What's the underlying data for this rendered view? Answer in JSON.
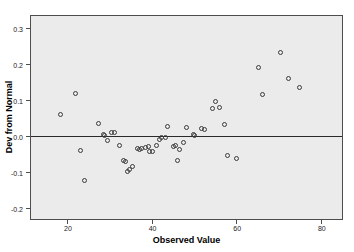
{
  "chart_data": {
    "type": "scatter",
    "title": "",
    "xlabel": "Observed Value",
    "ylabel": "Dev from Normal",
    "xlim": [
      11.5,
      85.0
    ],
    "ylim": [
      -0.232,
      0.333
    ],
    "xticks": [
      20,
      40,
      60,
      80
    ],
    "xtick_labels": [
      "20",
      "40",
      "60",
      "80"
    ],
    "yticks": [
      0.3,
      0.2,
      0.1,
      0.0,
      -0.1,
      -0.2
    ],
    "ytick_labels": [
      "0.3",
      "0.2",
      "0.1",
      "0.0",
      "-0.1",
      "-0.2"
    ],
    "grid": false,
    "legend": null,
    "reference_lines": [
      {
        "axis": "y",
        "value": 0.0
      }
    ],
    "marker": "open-circle",
    "marker_color": "#3a3a3a",
    "plot_background": "#ebebeb",
    "page_background": "#ffffff",
    "points": [
      {
        "x": 18.5,
        "y": 0.058
      },
      {
        "x": 22.0,
        "y": 0.116
      },
      {
        "x": 23.3,
        "y": -0.041
      },
      {
        "x": 24.2,
        "y": -0.125
      },
      {
        "x": 27.5,
        "y": 0.033
      },
      {
        "x": 28.7,
        "y": 0.002
      },
      {
        "x": 28.9,
        "y": 0.0
      },
      {
        "x": 29.5,
        "y": -0.014
      },
      {
        "x": 30.6,
        "y": 0.008
      },
      {
        "x": 31.2,
        "y": 0.01
      },
      {
        "x": 32.5,
        "y": -0.027
      },
      {
        "x": 33.4,
        "y": -0.068
      },
      {
        "x": 33.9,
        "y": -0.071
      },
      {
        "x": 34.3,
        "y": -0.1
      },
      {
        "x": 34.7,
        "y": -0.094
      },
      {
        "x": 35.4,
        "y": -0.085
      },
      {
        "x": 36.6,
        "y": -0.035
      },
      {
        "x": 37.1,
        "y": -0.038
      },
      {
        "x": 37.6,
        "y": -0.037
      },
      {
        "x": 38.6,
        "y": -0.033
      },
      {
        "x": 39.2,
        "y": -0.029
      },
      {
        "x": 39.6,
        "y": -0.045
      },
      {
        "x": 40.2,
        "y": -0.044
      },
      {
        "x": 41.2,
        "y": -0.028
      },
      {
        "x": 41.8,
        "y": -0.012
      },
      {
        "x": 42.4,
        "y": -0.006
      },
      {
        "x": 43.2,
        "y": -0.004
      },
      {
        "x": 43.8,
        "y": 0.026
      },
      {
        "x": 45.1,
        "y": -0.031
      },
      {
        "x": 45.6,
        "y": -0.028
      },
      {
        "x": 46.2,
        "y": -0.069
      },
      {
        "x": 46.5,
        "y": -0.038
      },
      {
        "x": 47.6,
        "y": -0.02
      },
      {
        "x": 48.3,
        "y": 0.024
      },
      {
        "x": 49.8,
        "y": 0.002
      },
      {
        "x": 50.1,
        "y": 0.0
      },
      {
        "x": 51.9,
        "y": 0.021
      },
      {
        "x": 52.4,
        "y": 0.018
      },
      {
        "x": 54.5,
        "y": 0.075
      },
      {
        "x": 55.2,
        "y": 0.094
      },
      {
        "x": 56.0,
        "y": 0.078
      },
      {
        "x": 57.2,
        "y": 0.031
      },
      {
        "x": 57.9,
        "y": -0.054
      },
      {
        "x": 60.1,
        "y": -0.065
      },
      {
        "x": 65.2,
        "y": 0.19
      },
      {
        "x": 66.1,
        "y": 0.115
      },
      {
        "x": 70.5,
        "y": 0.232
      },
      {
        "x": 72.3,
        "y": 0.158
      },
      {
        "x": 75.0,
        "y": 0.134
      }
    ]
  }
}
